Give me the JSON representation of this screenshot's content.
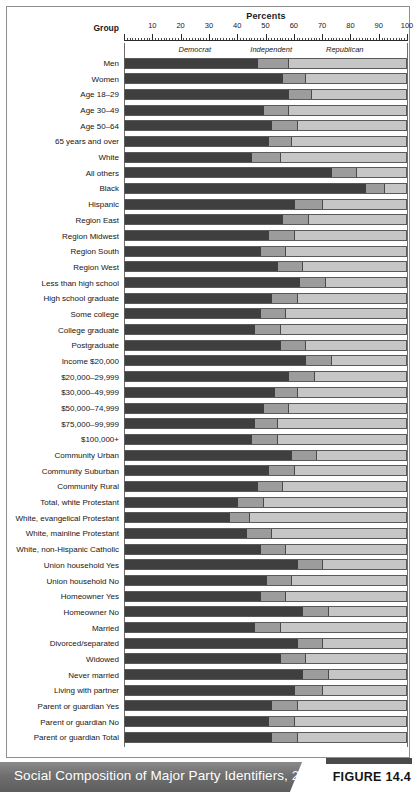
{
  "figure": {
    "percents_title": "Percents",
    "group_header": "Group",
    "caption": "Social Composition of Major Party Identifiers, 2008",
    "figure_number": "FIGURE 14.4"
  },
  "colors": {
    "democrat": "#3f3f3f",
    "independent": "#9c9c9c",
    "republican": "#c6c6c6",
    "panel_border": "#8e8e8e",
    "footer_band": "#6f6f6f"
  },
  "chart_data": {
    "type": "bar",
    "orientation": "horizontal",
    "stacked": true,
    "title": "Social Composition of Major Party Identifiers, 2008",
    "xlabel": "Percents",
    "ylabel": "Group",
    "xlim": [
      0,
      100
    ],
    "xticks": [
      10,
      20,
      30,
      40,
      50,
      60,
      70,
      80,
      90,
      100
    ],
    "grid": false,
    "legend_position": "top-inside",
    "legend": [
      "Democrat",
      "Independent",
      "Republican"
    ],
    "series": [
      {
        "name": "Democrat",
        "color": "#3f3f3f"
      },
      {
        "name": "Independent",
        "color": "#9c9c9c"
      },
      {
        "name": "Republican",
        "color": "#c6c6c6"
      }
    ],
    "categories": [
      "Men",
      "Women",
      "Age 18–29",
      "Age 30–49",
      "Age 50–64",
      "65 years and over",
      "White",
      "All others",
      "Black",
      "Hispanic",
      "Region East",
      "Region Midwest",
      "Region South",
      "Region West",
      "Less than high school",
      "High school graduate",
      "Some college",
      "College graduate",
      "Postgraduate",
      "Income $20,000",
      "$20,000–29,999",
      "$30,000–49,999",
      "$50,000–74,999",
      "$75,000–99,999",
      "$100,000+",
      "Community Urban",
      "Community Suburban",
      "Community Rural",
      "Total, white Protestant",
      "White, evangelical Protestant",
      "White, mainline Protestant",
      "White, non-Hispanic Catholic",
      "Union household Yes",
      "Union household No",
      "Homeowner Yes",
      "Homeowner No",
      "Married",
      "Divorced/separated",
      "Widowed",
      "Never married",
      "Living with partner",
      "Parent or guardian Yes",
      "Parent or guardian No",
      "Parent or guardian Total"
    ],
    "rows": [
      {
        "label": "Men",
        "democrat": 47,
        "independent": 11,
        "republican": 42
      },
      {
        "label": "Women",
        "democrat": 56,
        "independent": 8,
        "republican": 36
      },
      {
        "label": "Age 18–29",
        "democrat": 58,
        "independent": 8,
        "republican": 34
      },
      {
        "label": "Age 30–49",
        "democrat": 49,
        "independent": 9,
        "republican": 42
      },
      {
        "label": "Age 50–64",
        "democrat": 52,
        "independent": 9,
        "republican": 39
      },
      {
        "label": "65 years and over",
        "democrat": 51,
        "independent": 8,
        "republican": 41
      },
      {
        "label": "White",
        "democrat": 45,
        "independent": 10,
        "republican": 45
      },
      {
        "label": "All others",
        "democrat": 73,
        "independent": 9,
        "republican": 18
      },
      {
        "label": "Black",
        "democrat": 85,
        "independent": 7,
        "republican": 8
      },
      {
        "label": "Hispanic",
        "democrat": 60,
        "independent": 10,
        "republican": 30
      },
      {
        "label": "Region East",
        "democrat": 56,
        "independent": 9,
        "republican": 35
      },
      {
        "label": "Region Midwest",
        "democrat": 51,
        "independent": 9,
        "republican": 40
      },
      {
        "label": "Region South",
        "democrat": 48,
        "independent": 9,
        "republican": 43
      },
      {
        "label": "Region West",
        "democrat": 54,
        "independent": 9,
        "republican": 37
      },
      {
        "label": "Less than high school",
        "democrat": 62,
        "independent": 9,
        "republican": 29
      },
      {
        "label": "High school graduate",
        "democrat": 52,
        "independent": 9,
        "republican": 39
      },
      {
        "label": "Some college",
        "democrat": 48,
        "independent": 9,
        "republican": 43
      },
      {
        "label": "College graduate",
        "democrat": 46,
        "independent": 9,
        "republican": 45
      },
      {
        "label": "Postgraduate",
        "democrat": 55,
        "independent": 9,
        "republican": 36
      },
      {
        "label": "Income $20,000",
        "democrat": 64,
        "independent": 9,
        "republican": 27
      },
      {
        "label": "$20,000–29,999",
        "democrat": 58,
        "independent": 9,
        "republican": 33
      },
      {
        "label": "$30,000–49,999",
        "democrat": 53,
        "independent": 8,
        "republican": 39
      },
      {
        "label": "$50,000–74,999",
        "democrat": 49,
        "independent": 9,
        "republican": 42
      },
      {
        "label": "$75,000–99,999",
        "democrat": 46,
        "independent": 8,
        "republican": 46
      },
      {
        "label": "$100,000+",
        "democrat": 45,
        "independent": 9,
        "republican": 46
      },
      {
        "label": "Community Urban",
        "democrat": 59,
        "independent": 9,
        "republican": 32
      },
      {
        "label": "Community Suburban",
        "democrat": 51,
        "independent": 9,
        "republican": 40
      },
      {
        "label": "Community Rural",
        "democrat": 47,
        "independent": 9,
        "republican": 44
      },
      {
        "label": "Total, white Protestant",
        "democrat": 40,
        "independent": 9,
        "republican": 51
      },
      {
        "label": "White, evangelical Protestant",
        "democrat": 37,
        "independent": 7,
        "republican": 56
      },
      {
        "label": "White, mainline Protestant",
        "democrat": 43,
        "independent": 9,
        "republican": 48
      },
      {
        "label": "White, non-Hispanic Catholic",
        "democrat": 48,
        "independent": 9,
        "republican": 43
      },
      {
        "label": "Union household Yes",
        "democrat": 61,
        "independent": 9,
        "republican": 30
      },
      {
        "label": "Union household No",
        "democrat": 50,
        "independent": 9,
        "republican": 41
      },
      {
        "label": "Homeowner Yes",
        "democrat": 48,
        "independent": 9,
        "republican": 43
      },
      {
        "label": "Homeowner No",
        "democrat": 63,
        "independent": 9,
        "republican": 28
      },
      {
        "label": "Married",
        "democrat": 46,
        "independent": 9,
        "republican": 45
      },
      {
        "label": "Divorced/separated",
        "democrat": 61,
        "independent": 9,
        "republican": 30
      },
      {
        "label": "Widowed",
        "democrat": 55,
        "independent": 9,
        "republican": 36
      },
      {
        "label": "Never married",
        "democrat": 63,
        "independent": 9,
        "republican": 28
      },
      {
        "label": "Living with partner",
        "democrat": 60,
        "independent": 10,
        "republican": 30
      },
      {
        "label": "Parent or guardian Yes",
        "democrat": 52,
        "independent": 9,
        "republican": 39
      },
      {
        "label": "Parent or guardian No",
        "democrat": 51,
        "independent": 9,
        "republican": 40
      },
      {
        "label": "Parent or guardian Total",
        "democrat": 52,
        "independent": 9,
        "republican": 39
      }
    ]
  }
}
